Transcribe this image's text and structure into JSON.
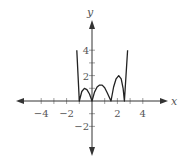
{
  "chart_data": {
    "type": "line",
    "title": "",
    "xlabel": "x",
    "ylabel": "y",
    "xlim": [
      -6,
      6
    ],
    "ylim": [
      -3,
      6
    ],
    "grid": false,
    "x_ticks": [
      -4,
      -3,
      -2,
      -1,
      1,
      2,
      3,
      4
    ],
    "x_tick_labels": [
      "−4",
      "−2",
      "2",
      "4"
    ],
    "x_tick_label_values": [
      -4,
      -2,
      2,
      4
    ],
    "y_ticks": [
      -2,
      -1,
      1,
      2,
      3,
      4
    ],
    "y_tick_labels": [
      "−2",
      "2",
      "4"
    ],
    "y_tick_label_values": [
      -2,
      2,
      4
    ],
    "series": [
      {
        "name": "y = |f(x)|",
        "points": [
          [
            -1.2,
            4.0
          ],
          [
            -1.0,
            0.0
          ],
          [
            -0.8,
            0.75
          ],
          [
            -0.6,
            1.0
          ],
          [
            -0.4,
            0.9
          ],
          [
            -0.2,
            0.55
          ],
          [
            0.0,
            0.0
          ],
          [
            0.2,
            0.7
          ],
          [
            0.4,
            1.1
          ],
          [
            0.6,
            1.25
          ],
          [
            0.8,
            1.25
          ],
          [
            1.0,
            1.05
          ],
          [
            1.2,
            0.65
          ],
          [
            1.5,
            0.0
          ],
          [
            1.7,
            1.1
          ],
          [
            1.9,
            1.75
          ],
          [
            2.1,
            2.0
          ],
          [
            2.3,
            1.75
          ],
          [
            2.45,
            1.0
          ],
          [
            2.55,
            0.0
          ],
          [
            2.8,
            4.0
          ]
        ]
      }
    ]
  },
  "labels": {
    "x_axis": "x",
    "y_axis": "y"
  },
  "colors": {
    "curve": "#222222",
    "axes": "#333333",
    "text": "#555555"
  }
}
